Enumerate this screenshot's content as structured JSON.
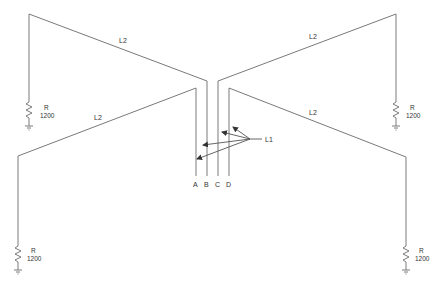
{
  "diagram": {
    "type": "antenna-schematic",
    "terminals": [
      {
        "id": "A",
        "label": "A"
      },
      {
        "id": "B",
        "label": "B"
      },
      {
        "id": "C",
        "label": "C"
      },
      {
        "id": "D",
        "label": "D"
      }
    ],
    "l1": {
      "label": "L1"
    },
    "l2_labels": {
      "top_left": "L2",
      "bottom_left": "L2",
      "top_right": "L2",
      "bottom_right": "L2"
    },
    "resistors": {
      "top_left": {
        "name": "R",
        "value": "1200"
      },
      "bottom_left": {
        "name": "R",
        "value": "1200"
      },
      "top_right": {
        "name": "R",
        "value": "1200"
      },
      "bottom_right": {
        "name": "R",
        "value": "1200"
      }
    },
    "colors": {
      "wire": "#7a7a7a",
      "text": "#333333",
      "background": "#ffffff"
    }
  }
}
